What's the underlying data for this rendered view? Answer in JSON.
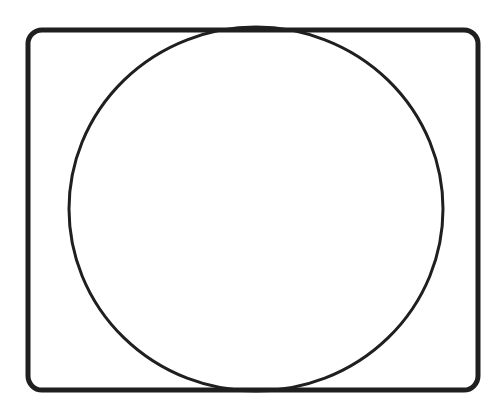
{
  "canvas": {
    "width": 502,
    "height": 413,
    "background": "#ffffff"
  },
  "stroke_color": "#1f1f1f",
  "shapes": [
    {
      "type": "rounded-rectangle",
      "x": 28,
      "y": 30,
      "width": 450,
      "height": 360,
      "rx": 14,
      "stroke_width": 5
    },
    {
      "type": "ellipse",
      "cx": 256,
      "cy": 209,
      "rx": 187,
      "ry": 182,
      "stroke_width": 3
    }
  ]
}
